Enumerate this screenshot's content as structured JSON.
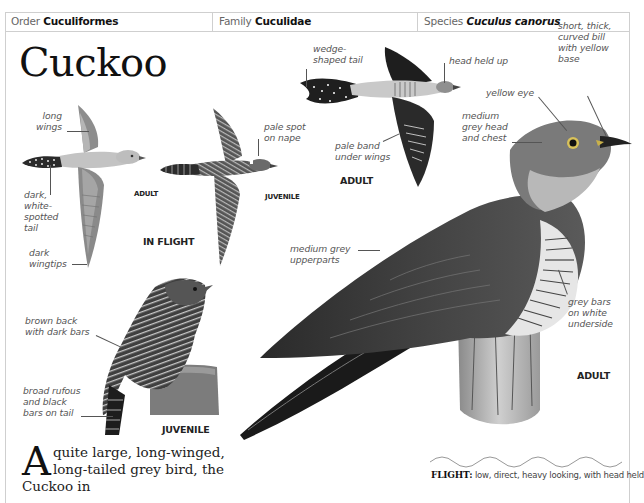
{
  "header": {
    "order": {
      "label": "Order",
      "value": "Cuculiformes"
    },
    "family": {
      "label": "Family",
      "value": "Cuculidae"
    },
    "species": {
      "label": "Species",
      "value": "Cuculus canorus"
    }
  },
  "title": "Cuckoo",
  "illustrations": {
    "in_flight": {
      "caption": "IN FLIGHT",
      "adult": {
        "caption": "ADULT",
        "labels": {
          "long_wings": "long\nwings",
          "tail": "dark,\nwhite-\nspotted\ntail",
          "wingtips": "dark\nwingtips"
        }
      },
      "juvenile": {
        "caption": "JUVENILE",
        "labels": {
          "nape": "pale spot\non nape"
        }
      }
    },
    "flying_adult": {
      "caption": "ADULT",
      "labels": {
        "tail": "wedge-\nshaped tail",
        "head": "head held up",
        "underwing": "pale band\nunder wings"
      }
    },
    "perched_juvenile": {
      "caption": "JUVENILE",
      "labels": {
        "back": "brown back\nwith dark bars",
        "tail": "broad rufous\nand black\nbars on tail"
      }
    },
    "perched_adult": {
      "caption": "ADULT",
      "labels": {
        "bill": "short, thick,\ncurved bill\nwith yellow\nbase",
        "eye": "yellow eye",
        "head": "medium\ngrey head\nand chest",
        "upperparts": "medium grey\nupperparts",
        "underside": "grey bars\non white\nunderside"
      }
    }
  },
  "body": {
    "dropcap": "A",
    "text": "quite large, long-winged, long-tailed grey bird, the Cuckoo in"
  },
  "flight_note": {
    "label": "FLIGHT:",
    "text": " low, direct, heavy looking, with head held"
  }
}
